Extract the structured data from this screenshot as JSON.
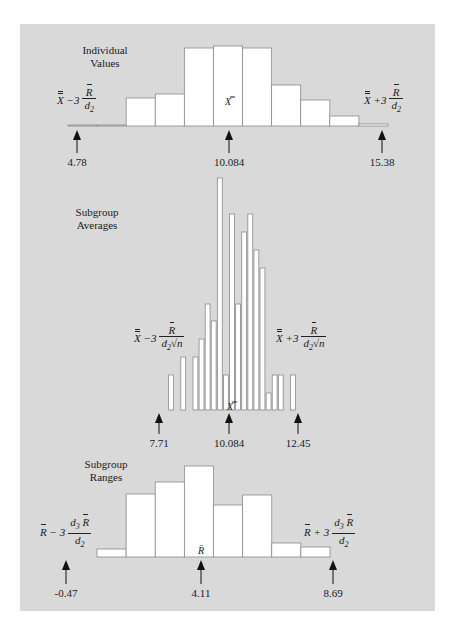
{
  "figure": {
    "panel_color": "#d9d9d9",
    "bar_fill": "#ffffff",
    "bar_stroke": "#8a8a8a",
    "arrow_color": "#111111"
  },
  "chart_data": [
    {
      "type": "bar",
      "title": "Individual Values",
      "title_lines": [
        "Individual",
        "Values"
      ],
      "center_symbol": "X̿",
      "lower_formula": "X̿ − 3 R̄ / d2",
      "upper_formula": "X̿ + 3 R̄ / d2",
      "markers": [
        {
          "label": "4.78",
          "role": "LCL"
        },
        {
          "label": "10.084",
          "role": "center"
        },
        {
          "label": "15.38",
          "role": "UCL"
        }
      ],
      "relative_heights": [
        1,
        1,
        28,
        32,
        78,
        80,
        78,
        41,
        26,
        10,
        2
      ],
      "xlim": [
        4.78,
        15.38
      ]
    },
    {
      "type": "bar",
      "title": "Subgroup Averages",
      "title_lines": [
        "Subgroup",
        "Averages"
      ],
      "center_symbol": "X̿",
      "lower_formula": "X̿ − 3 R̄ / (d2 √n)",
      "upper_formula": "X̿ + 3 R̄ / (d2 √n)",
      "markers": [
        {
          "label": "7.71",
          "role": "LCL"
        },
        {
          "label": "10.084",
          "role": "center"
        },
        {
          "label": "12.45",
          "role": "UCL"
        }
      ],
      "relative_heights": [
        35,
        0,
        53,
        0,
        53,
        71,
        106,
        89,
        232,
        35,
        196,
        106,
        178,
        196,
        160,
        142,
        17,
        35,
        35,
        0,
        35
      ],
      "xlim": [
        7.71,
        12.45
      ]
    },
    {
      "type": "bar",
      "title": "Subgroup Ranges",
      "title_lines": [
        "Subgroup",
        "Ranges"
      ],
      "center_symbol": "R̄",
      "lower_formula": "R̄ − 3 d3 R̄ / d2",
      "upper_formula": "R̄ + 3 d3 R̄ / d2",
      "markers": [
        {
          "label": "-0.47",
          "role": "LCL"
        },
        {
          "label": "4.11",
          "role": "center"
        },
        {
          "label": "8.69",
          "role": "UCL"
        }
      ],
      "relative_heights": [
        8,
        63,
        75,
        91,
        52,
        62,
        14,
        10
      ],
      "xlim": [
        -0.47,
        8.69
      ]
    }
  ]
}
